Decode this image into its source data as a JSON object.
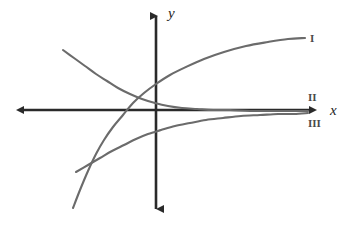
{
  "figure": {
    "kind": "coordinate-plane-line-graph",
    "background_color": "#ffffff",
    "axis_color": "#2a2a2a",
    "curve_color": "#6b6b6b",
    "label_color": "#1e1e1e"
  },
  "axes": {
    "x_label": "x",
    "y_label": "y",
    "origin": {
      "x": 156,
      "y": 110
    },
    "x_axis": {
      "from_x": 18,
      "to_x": 317,
      "y": 110,
      "arrows": "both"
    },
    "y_axis": {
      "x": 156,
      "from_y": 10,
      "to_y": 215,
      "arrows": "both"
    }
  },
  "curve_labels": [
    {
      "id": "I",
      "text": "I",
      "x": 310,
      "y": 33
    },
    {
      "id": "II",
      "text": "II",
      "x": 308,
      "y": 92
    },
    {
      "id": "III",
      "text": "III",
      "x": 308,
      "y": 118
    }
  ],
  "chart_data": {
    "type": "line",
    "title": "",
    "xlabel": "x",
    "ylabel": "y",
    "grid": false,
    "legend": "inline-right-end-labels",
    "axis_style": "double-arrow cartesian axes, unlabeled ticks",
    "series": [
      {
        "name": "I",
        "shape": "increasing-concave-down (logarithmic / saturating growth)",
        "label_position": {
          "x": 310,
          "y": 33
        },
        "points_px": [
          [
            73,
            208
          ],
          [
            80,
            190
          ],
          [
            88,
            171
          ],
          [
            96,
            154
          ],
          [
            104,
            140
          ],
          [
            113,
            127
          ],
          [
            123,
            115
          ],
          [
            133,
            103
          ],
          [
            144,
            93
          ],
          [
            156,
            84
          ],
          [
            170,
            75
          ],
          [
            186,
            67
          ],
          [
            204,
            59
          ],
          [
            224,
            52
          ],
          [
            246,
            46
          ],
          [
            268,
            42
          ],
          [
            288,
            39
          ],
          [
            305,
            38
          ]
        ]
      },
      {
        "name": "II",
        "shape": "decreasing-convex (exponential decay toward x-axis asymptote)",
        "label_position": {
          "x": 308,
          "y": 92
        },
        "points_px": [
          [
            63,
            50
          ],
          [
            74,
            58
          ],
          [
            85,
            66
          ],
          [
            96,
            74
          ],
          [
            107,
            81
          ],
          [
            118,
            88
          ],
          [
            130,
            94
          ],
          [
            142,
            99
          ],
          [
            155,
            103
          ],
          [
            168,
            106
          ],
          [
            182,
            108
          ],
          [
            197,
            109
          ],
          [
            213,
            110
          ],
          [
            230,
            110
          ],
          [
            250,
            111
          ],
          [
            272,
            111
          ],
          [
            292,
            111
          ],
          [
            308,
            111
          ]
        ]
      },
      {
        "name": "III",
        "shape": "increasing-concave-down approaching x-axis from below",
        "label_position": {
          "x": 308,
          "y": 118
        },
        "points_px": [
          [
            76,
            172
          ],
          [
            88,
            165
          ],
          [
            100,
            158
          ],
          [
            112,
            151
          ],
          [
            124,
            145
          ],
          [
            136,
            139
          ],
          [
            148,
            134
          ],
          [
            161,
            130
          ],
          [
            175,
            126
          ],
          [
            190,
            123
          ],
          [
            206,
            120
          ],
          [
            223,
            118
          ],
          [
            241,
            116
          ],
          [
            260,
            115
          ],
          [
            278,
            114
          ],
          [
            294,
            114
          ],
          [
            308,
            113
          ]
        ]
      }
    ]
  }
}
